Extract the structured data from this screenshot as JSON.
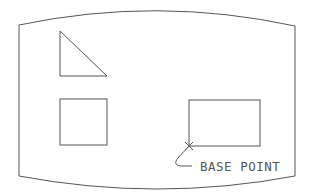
{
  "diagram": {
    "label": "BASE POINT",
    "stroke_color": "#555555",
    "background": "#ffffff",
    "shapes": [
      {
        "type": "frame",
        "name": "screen-outline"
      },
      {
        "type": "triangle",
        "name": "right-triangle"
      },
      {
        "type": "square",
        "name": "square"
      },
      {
        "type": "rectangle",
        "name": "rectangle"
      },
      {
        "type": "marker",
        "name": "base-point-x"
      }
    ]
  }
}
